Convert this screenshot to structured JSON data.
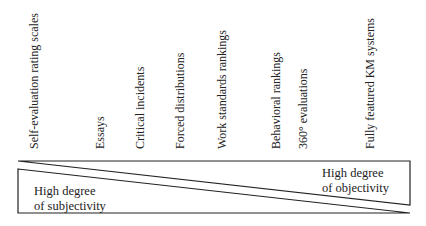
{
  "methods": [
    {
      "label": "Self-evaluation rating scales",
      "x": 34,
      "bottom": 149
    },
    {
      "label": "Essays",
      "x": 100,
      "bottom": 149
    },
    {
      "label": "Critical incidents",
      "x": 140,
      "bottom": 149
    },
    {
      "label": "Forced distributions",
      "x": 180,
      "bottom": 149
    },
    {
      "label": "Work standards rankings",
      "x": 222,
      "bottom": 149
    },
    {
      "label": "Behavioral rankings",
      "x": 276,
      "bottom": 149
    },
    {
      "label": "360° evaluations",
      "x": 303,
      "bottom": 149
    },
    {
      "label": "Fully featured KM systems",
      "x": 370,
      "bottom": 149
    }
  ],
  "subjectivity": {
    "line1": "High degree",
    "line2": "of subjectivity"
  },
  "objectivity": {
    "line1": "High degree",
    "line2": "of objectivity"
  }
}
